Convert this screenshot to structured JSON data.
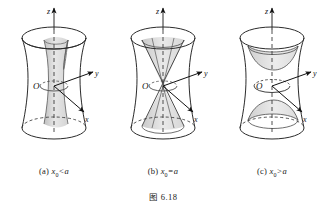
{
  "figure": {
    "number_label": "图 6.18",
    "panels": [
      {
        "id": "panel-a",
        "tag": "(a)",
        "condition_prefix": "x",
        "condition_sub": "0",
        "condition_suffix": "<a",
        "caption": "(a) x0<a",
        "inner_surface": "hyperboloid-of-one-sheet",
        "axes": {
          "z": "z",
          "y": "y",
          "x": "x",
          "origin": "O"
        }
      },
      {
        "id": "panel-b",
        "tag": "(b)",
        "condition_prefix": "x",
        "condition_sub": "0",
        "condition_suffix": "=a",
        "caption": "(b) x0=a",
        "inner_surface": "cone",
        "axes": {
          "z": "z",
          "y": "y",
          "x": "x",
          "origin": "O"
        }
      },
      {
        "id": "panel-c",
        "tag": "(c)",
        "condition_prefix": "x",
        "condition_sub": "0",
        "condition_suffix": ">a",
        "caption": "(c) x0>a",
        "inner_surface": "hyperboloid-of-two-sheets",
        "axes": {
          "z": "z",
          "y": "y",
          "x": "x",
          "origin": "O"
        }
      }
    ]
  },
  "colors": {
    "stroke": "#2b2b2b",
    "shade_light": "#e3e3e3",
    "shade_mid": "#cfcfcf",
    "background": "#ffffff"
  }
}
